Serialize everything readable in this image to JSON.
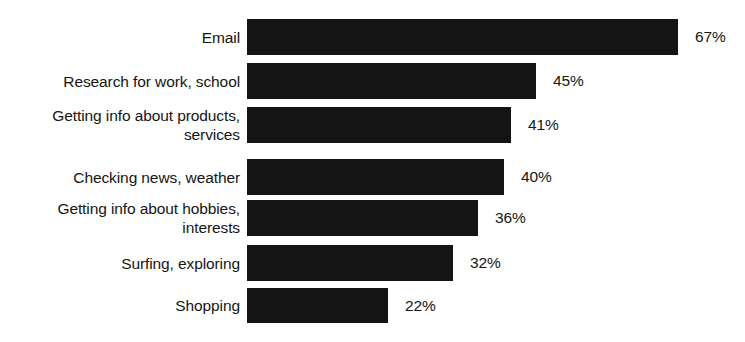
{
  "chart_data": {
    "type": "bar",
    "orientation": "horizontal",
    "title": "",
    "subtitle": "",
    "xlabel": "",
    "ylabel": "",
    "grid": false,
    "legend": false,
    "axis_visible": false,
    "value_suffix": "%",
    "xlim": [
      0,
      67
    ],
    "categories": [
      "Email",
      "Research for work, school",
      "Getting info about products,\nservices",
      "Checking news, weather",
      "Getting info about hobbies,\ninterests",
      "Surfing, exploring",
      "Shopping"
    ],
    "values": [
      67,
      45,
      41,
      40,
      36,
      32,
      22
    ],
    "value_labels": [
      "67%",
      "45%",
      "41%",
      "40%",
      "36%",
      "32%",
      "22%"
    ],
    "bar_color": "#141414",
    "background_color": "#ffffff",
    "text_color": "#151515"
  },
  "layout": {
    "bar_origin_x": 247,
    "px_per_unit": 6.43,
    "row_tops": [
      18,
      63,
      107,
      159,
      200,
      245,
      288
    ],
    "row_heights": [
      38,
      36,
      36,
      36,
      36,
      36,
      35
    ]
  }
}
